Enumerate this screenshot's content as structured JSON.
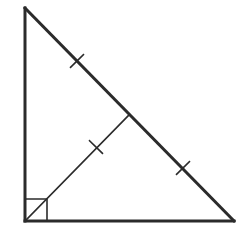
{
  "diagram": {
    "type": "right-triangle-with-median",
    "colors": {
      "stroke": "#2b2b2b",
      "background": "#ffffff"
    },
    "vertices": {
      "top": [
        25,
        8
      ],
      "right_angle": [
        25,
        221
      ],
      "right": [
        234,
        221
      ]
    },
    "median_endpoint": [
      129.5,
      114.5
    ],
    "right_angle_marker_size": 22,
    "tick_marks": [
      {
        "segment": "hypotenuse-upper-half",
        "center": [
          77,
          61
        ]
      },
      {
        "segment": "median",
        "center": [
          96,
          147
        ]
      },
      {
        "segment": "hypotenuse-lower-half",
        "center": [
          183,
          168
        ]
      }
    ]
  }
}
